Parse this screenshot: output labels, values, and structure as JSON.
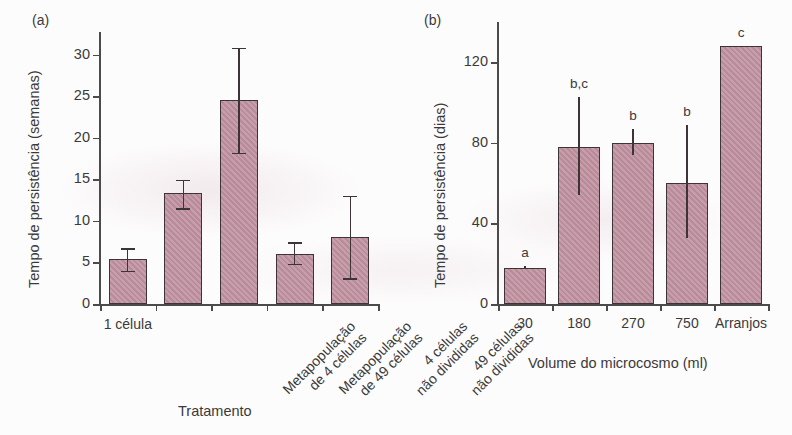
{
  "figure": {
    "background_color": "#fdfcfc",
    "bar_fill_color": "#b98a99",
    "bar_edge_color": "#3c3438"
  },
  "panel_a": {
    "tag": "(a)",
    "ylabel": "Tempo de persistência (semanas)",
    "xlabel": "Tratamento"
  },
  "panel_b": {
    "tag": "(b)",
    "ylabel": "Tempo de persistência (dias)",
    "xlabel": "Volume do microcosmo (ml)"
  },
  "chart_data": [
    {
      "type": "bar",
      "panel": "(a)",
      "title": "",
      "xlabel": "Tratamento",
      "ylabel": "Tempo de persistência (semanas)",
      "ylim": [
        0,
        32
      ],
      "yticks": [
        0,
        5,
        10,
        15,
        20,
        25,
        30
      ],
      "ytick_labels": [
        "0",
        "5",
        "10",
        "15",
        "20",
        "25",
        "30"
      ],
      "grid": false,
      "legend": "none",
      "categories": [
        "1 célula",
        "Metapopulação de 4 células",
        "Metapopulação de 49 células",
        "4 células não divididas",
        "49 células não divididas"
      ],
      "category_lines": [
        [
          "1 célula"
        ],
        [
          "Metapopulação",
          "de 4 células"
        ],
        [
          "Metapopulação",
          "de 49 células"
        ],
        [
          "4 células",
          "não divididas"
        ],
        [
          "49 células",
          "não divididas"
        ]
      ],
      "values": [
        5.4,
        13.3,
        24.5,
        6.0,
        8.1
      ],
      "error_low": [
        4.0,
        11.5,
        18.2,
        4.8,
        3.1
      ],
      "error_high": [
        6.7,
        14.9,
        30.8,
        7.4,
        13.0
      ],
      "error_style": "capped"
    },
    {
      "type": "bar",
      "panel": "(b)",
      "title": "",
      "xlabel": "Volume do microcosmo (ml)",
      "ylabel": "Tempo de persistência (dias)",
      "ylim": [
        0,
        140
      ],
      "yticks": [
        0,
        40,
        80,
        120
      ],
      "ytick_labels": [
        "0",
        "40",
        "80",
        "120"
      ],
      "grid": false,
      "legend": "none",
      "categories": [
        "30",
        "180",
        "270",
        "750",
        "Arranjos"
      ],
      "values": [
        18,
        78,
        80,
        60,
        128
      ],
      "error_low": [
        18,
        54,
        74,
        33,
        128
      ],
      "error_high": [
        19,
        103,
        87,
        89,
        128
      ],
      "error_style": "line",
      "significance_labels": [
        "a",
        "b,c",
        "b",
        "b",
        "c"
      ]
    }
  ]
}
